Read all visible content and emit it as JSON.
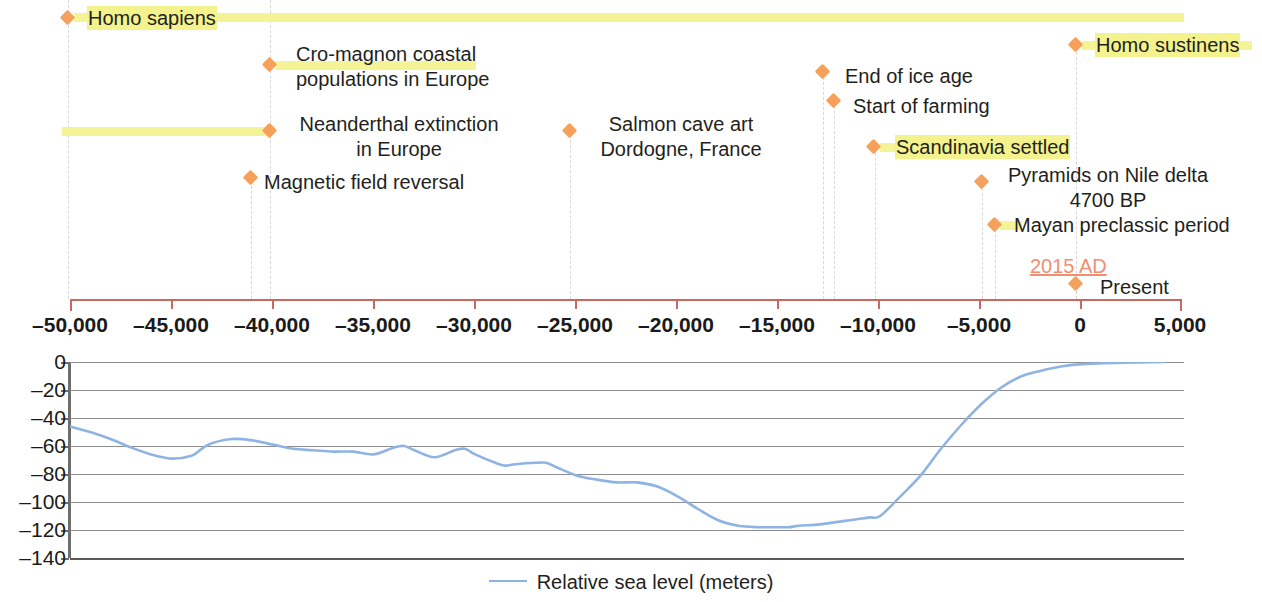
{
  "figure": {
    "accent_orange": "#f5a15c",
    "highlight_yellow": "#f3f28c",
    "axis_red": "#c9685e",
    "sea_blue": "#8fb4e3",
    "present_year_label": "2015 AD"
  },
  "timeline": {
    "axis": {
      "label": "",
      "min": -50000,
      "max": 5000,
      "ticks": [
        {
          "value": -50000,
          "label": "–50,000"
        },
        {
          "value": -45000,
          "label": "–45,000"
        },
        {
          "value": -40000,
          "label": "–40,000"
        },
        {
          "value": -35000,
          "label": "–35,000"
        },
        {
          "value": -30000,
          "label": "–30,000"
        },
        {
          "value": -25000,
          "label": "–25,000"
        },
        {
          "value": -20000,
          "label": "–20,000"
        },
        {
          "value": -15000,
          "label": "–15,000"
        },
        {
          "value": -10000,
          "label": "–10,000"
        },
        {
          "value": -5000,
          "label": "–5,000"
        },
        {
          "value": 0,
          "label": "0"
        },
        {
          "value": 5000,
          "label": "5,000"
        }
      ]
    },
    "events": [
      {
        "id": "homo-sapiens",
        "label": "Homo sapiens",
        "line2": "",
        "year": -50000,
        "highlighted": true
      },
      {
        "id": "homo-sustinens",
        "label": "Homo sustinens",
        "line2": "",
        "year": 0,
        "highlighted": true
      },
      {
        "id": "cro-magnon",
        "label": "Cro-magnon coastal",
        "line2": "populations in Europe",
        "year": -40000,
        "highlighted": true
      },
      {
        "id": "end-of-ice-age",
        "label": "End of ice age",
        "line2": "",
        "year": -12000,
        "highlighted": false
      },
      {
        "id": "start-of-farming",
        "label": "Start of farming",
        "line2": "",
        "year": -11500,
        "highlighted": false
      },
      {
        "id": "neanderthal-extinction",
        "label": "Neanderthal extinction",
        "line2": "in Europe",
        "year": -40000,
        "highlighted": true
      },
      {
        "id": "salmon-cave-art",
        "label": "Salmon cave art",
        "line2": "Dordogne, France",
        "year": -24800,
        "highlighted": false
      },
      {
        "id": "scandinavia-settled",
        "label": "Scandinavia settled",
        "line2": "",
        "year": -10000,
        "highlighted": true
      },
      {
        "id": "magnetic-field-reversal",
        "label": "Magnetic field reversal",
        "line2": "",
        "year": -41000,
        "highlighted": false
      },
      {
        "id": "pyramids-nile-delta",
        "label": "Pyramids on Nile delta",
        "line2": "4700 BP",
        "year": -4700,
        "highlighted": false
      },
      {
        "id": "mayan-preclassic",
        "label": "Mayan preclassic period",
        "line2": "",
        "year": -4000,
        "highlighted": true
      },
      {
        "id": "present",
        "label": "Present",
        "line2": "",
        "year": 0,
        "highlighted": false
      }
    ]
  },
  "chart_data": {
    "type": "line",
    "title": "",
    "xlabel": "",
    "ylabel": "",
    "xlim": [
      -50000,
      5000
    ],
    "ylim": [
      -140,
      0
    ],
    "grid": true,
    "legend_position": "bottom",
    "xticks": [
      -50000,
      -45000,
      -40000,
      -35000,
      -30000,
      -25000,
      -20000,
      -15000,
      -10000,
      -5000,
      0,
      5000
    ],
    "yticks": [
      0,
      -20,
      -40,
      -60,
      -80,
      -100,
      -120,
      -140
    ],
    "ytick_labels": [
      "0",
      "–20",
      "–40",
      "–60",
      "–80",
      "–100",
      "–120",
      "–140"
    ],
    "series": [
      {
        "name": "Relative sea level (meters)",
        "color": "#8fb4e3",
        "x": [
          -50000,
          -49000,
          -48000,
          -47000,
          -46000,
          -45000,
          -44000,
          -43500,
          -43000,
          -42000,
          -41000,
          -40000,
          -39000,
          -38000,
          -37000,
          -36000,
          -35000,
          -34000,
          -33500,
          -33000,
          -32000,
          -31000,
          -30500,
          -30000,
          -29000,
          -28500,
          -28000,
          -27000,
          -26500,
          -26000,
          -25000,
          -24000,
          -23000,
          -22000,
          -21000,
          -20000,
          -19000,
          -18000,
          -17000,
          -16000,
          -15000,
          -14500,
          -14000,
          -13000,
          -12000,
          -11500,
          -11000,
          -10500,
          -10000,
          -9000,
          -8000,
          -7000,
          -6000,
          -5000,
          -4000,
          -3000,
          -2000,
          -1000,
          0,
          2000,
          4000
        ],
        "y": [
          -46,
          -50,
          -55,
          -61,
          -66,
          -69,
          -67,
          -62,
          -58,
          -55,
          -56,
          -59,
          -62,
          -63,
          -64,
          -64,
          -66,
          -61,
          -60,
          -63,
          -68,
          -63,
          -62,
          -66,
          -72,
          -74,
          -73,
          -72,
          -72,
          -75,
          -81,
          -84,
          -86,
          -86,
          -89,
          -96,
          -105,
          -113,
          -117,
          -118,
          -118,
          -118,
          -117,
          -116,
          -114,
          -113,
          -112,
          -111,
          -110,
          -96,
          -81,
          -62,
          -45,
          -30,
          -18,
          -10,
          -6,
          -3,
          -1.5,
          -0.5,
          0
        ]
      }
    ],
    "legend": [
      "Relative sea level (meters)"
    ]
  }
}
